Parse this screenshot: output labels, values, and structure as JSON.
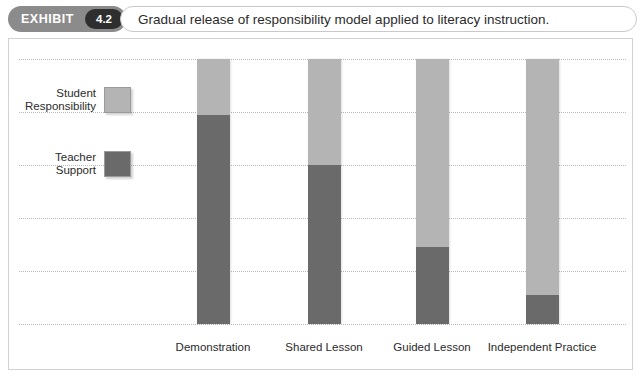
{
  "header": {
    "badge_word": "EXHIBIT",
    "badge_number": "4.2",
    "title": "Gradual release of responsibility model applied to literacy instruction."
  },
  "legend": {
    "items": [
      {
        "label": "Student\nResponsibility",
        "color": "#b4b4b4",
        "name": "student-responsibility"
      },
      {
        "label": "Teacher\nSupport",
        "color": "#6a6a6a",
        "name": "teacher-support"
      }
    ]
  },
  "chart_data": {
    "type": "bar",
    "stacked": true,
    "title": "Gradual release of responsibility model applied to literacy instruction.",
    "xlabel": "",
    "ylabel": "",
    "grid": true,
    "legend_position": "left",
    "categories": [
      "Demonstration",
      "Shared Lesson",
      "Guided Lesson",
      "Independent Practice"
    ],
    "series": [
      {
        "name": "Student Responsibility",
        "color": "#b4b4b4",
        "values": [
          21,
          40,
          71,
          89
        ]
      },
      {
        "name": "Teacher Support",
        "color": "#6a6a6a",
        "values": [
          79,
          60,
          29,
          11
        ]
      }
    ],
    "ylim": [
      0,
      100
    ],
    "gridline_values": [
      100,
      80,
      60,
      40,
      20,
      0
    ]
  }
}
